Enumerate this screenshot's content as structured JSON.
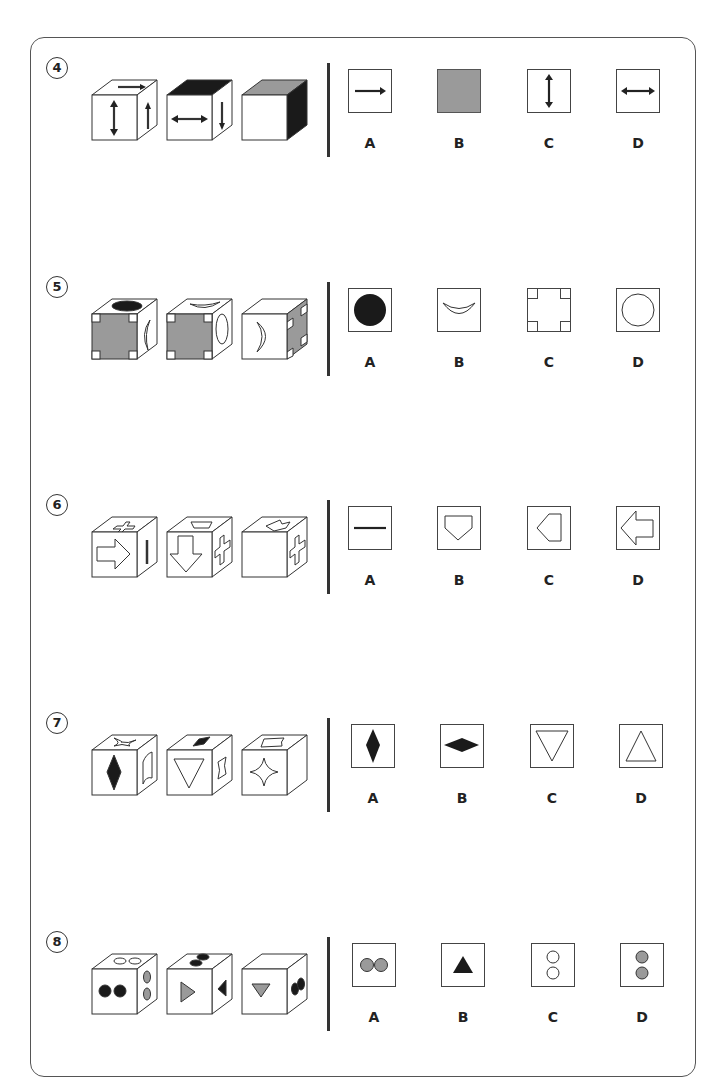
{
  "colors": {
    "line": "#333333",
    "gray": "#9a9a9a",
    "black": "#1a1a1a"
  },
  "questions": [
    {
      "number": "4",
      "cubes": [
        {
          "front": "double-arrow-vertical",
          "right": "arrow-up",
          "top": "arrow-right"
        },
        {
          "front": "double-arrow-horizontal",
          "right": "arrow-down",
          "top": "black-fill"
        },
        {
          "front": "blank",
          "right": "black-fill",
          "top": "gray-fill"
        }
      ],
      "options": [
        {
          "label": "A",
          "content": "arrow-right"
        },
        {
          "label": "B",
          "content": "gray-fill"
        },
        {
          "label": "C",
          "content": "double-arrow-vertical"
        },
        {
          "label": "D",
          "content": "double-arrow-horizontal"
        }
      ]
    },
    {
      "number": "5",
      "cubes": [
        {
          "front": "gray-cross",
          "right": "crescent",
          "top": "black-circle"
        },
        {
          "front": "gray-cross",
          "right": "circle-outline",
          "top": "crescent"
        },
        {
          "front": "crescent",
          "right": "gray-cross",
          "top": "blank"
        }
      ],
      "options": [
        {
          "label": "A",
          "content": "black-circle"
        },
        {
          "label": "B",
          "content": "crescent"
        },
        {
          "label": "C",
          "content": "corner-squares"
        },
        {
          "label": "D",
          "content": "circle-outline"
        }
      ]
    },
    {
      "number": "6",
      "cubes": [
        {
          "front": "arrow-right-outline",
          "right": "vertical-line",
          "top": "cross-outline"
        },
        {
          "front": "arrow-down-outline",
          "right": "cross-outline",
          "top": "pentagon"
        },
        {
          "front": "blank",
          "right": "cross-outline",
          "top": "arrow-outline"
        }
      ],
      "options": [
        {
          "label": "A",
          "content": "horizontal-line"
        },
        {
          "label": "B",
          "content": "pentagon-down"
        },
        {
          "label": "C",
          "content": "pentagon-left"
        },
        {
          "label": "D",
          "content": "arrow-left-outline"
        }
      ]
    },
    {
      "number": "7",
      "cubes": [
        {
          "front": "black-diamond-vertical",
          "right": "arch",
          "top": "star-outline"
        },
        {
          "front": "triangle-down-outline",
          "right": "arch-side",
          "top": "black-diamond"
        },
        {
          "front": "star-outline",
          "right": "blank",
          "top": "arch"
        }
      ],
      "options": [
        {
          "label": "A",
          "content": "black-diamond-vertical"
        },
        {
          "label": "B",
          "content": "black-diamond-horizontal"
        },
        {
          "label": "C",
          "content": "triangle-down-outline"
        },
        {
          "label": "D",
          "content": "triangle-up-outline"
        }
      ]
    },
    {
      "number": "8",
      "cubes": [
        {
          "front": "two-black-dots",
          "right": "two-gray-dots-vertical",
          "top": "two-white-dots"
        },
        {
          "front": "gray-triangle-right",
          "right": "black-triangle-left",
          "top": "two-black-dots"
        },
        {
          "front": "gray-triangle-down",
          "right": "two-black-dots",
          "top": "blank"
        }
      ],
      "options": [
        {
          "label": "A",
          "content": "two-gray-dots-horizontal"
        },
        {
          "label": "B",
          "content": "black-triangle-up"
        },
        {
          "label": "C",
          "content": "two-white-dots-vertical"
        },
        {
          "label": "D",
          "content": "two-gray-dots-vertical"
        }
      ]
    }
  ]
}
